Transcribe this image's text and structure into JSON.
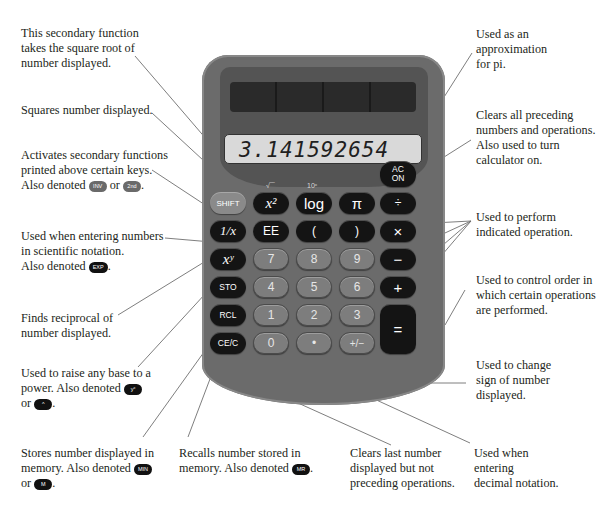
{
  "calculator": {
    "display": "3.141592654",
    "secondary_labels": {
      "sqrt": "√‾‾",
      "log_secondary": "10ˣ"
    },
    "keys": {
      "ac_on_top": "AC",
      "ac_on_bottom": "ON",
      "shift": "SHIFT",
      "square": "x²",
      "log": "log",
      "pi": "π",
      "divide": "÷",
      "reciprocal": "1/x",
      "ee": "EE",
      "open_paren": "(",
      "close_paren": ")",
      "multiply": "×",
      "power": "xʸ",
      "seven": "7",
      "eight": "8",
      "nine": "9",
      "minus": "−",
      "sto": "STO",
      "four": "4",
      "five": "5",
      "six": "6",
      "plus": "+",
      "rcl": "RCL",
      "one": "1",
      "two": "2",
      "three": "3",
      "equals": "=",
      "ce_c": "CE/C",
      "zero": "0",
      "decimal": "•",
      "sign": "+/−"
    }
  },
  "annotations": {
    "square_root": {
      "lines": [
        "This secondary function",
        "takes the square root of",
        "number displayed."
      ]
    },
    "square": {
      "lines": [
        "Squares number displayed."
      ]
    },
    "shift": {
      "lines": [
        "Activates secondary functions",
        "printed above certain keys."
      ],
      "also": "Also denoted",
      "chip1": "INV",
      "or": "or",
      "chip2": "2nd",
      "end": "."
    },
    "ee": {
      "lines": [
        "Used when entering numbers",
        "in scientific notation."
      ],
      "also": "Also denoted",
      "chip1": "EXP",
      "end": "."
    },
    "reciprocal": {
      "lines": [
        "Finds reciprocal of",
        "number displayed."
      ]
    },
    "power": {
      "lines": [
        "Used to raise any base to a"
      ],
      "also": "power. Also denoted",
      "chip1": "yˣ",
      "or": "or",
      "chip2": "^",
      "end": "."
    },
    "sto": {
      "lines": [
        "Stores number displayed in"
      ],
      "also": "memory. Also denoted",
      "chip1": "MIN",
      "or": "or",
      "chip2": "M",
      "end": "."
    },
    "rcl": {
      "lines": [
        "Recalls number stored in"
      ],
      "also": "memory. Also denoted",
      "chip1": "MR",
      "end": "."
    },
    "ce_c": {
      "lines": [
        "Clears last number",
        "displayed but not",
        "preceding operations."
      ]
    },
    "decimal": {
      "lines": [
        "Used when",
        "entering",
        "decimal notation."
      ]
    },
    "pi": {
      "lines": [
        "Used as an",
        "approximation",
        "for pi."
      ]
    },
    "ac_on": {
      "lines": [
        "Clears all preceding",
        "numbers and operations.",
        "Also used to turn",
        "calculator on."
      ]
    },
    "operations": {
      "lines": [
        "Used to perform",
        "indicated operation."
      ]
    },
    "parentheses": {
      "lines": [
        "Used to control order in",
        "which certain operations",
        "are performed."
      ]
    },
    "sign": {
      "lines": [
        "Used to change",
        "sign of number",
        "displayed."
      ]
    }
  }
}
